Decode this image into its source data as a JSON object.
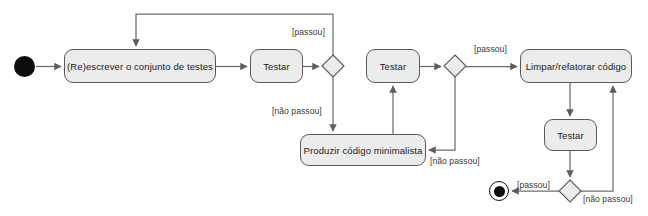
{
  "diagram": {
    "type": "uml-activity-diagram",
    "background_color": "#ffffff",
    "node_fill_color": "#ececec",
    "node_border_color": "#5a5a5a",
    "edge_color": "#6e6e6e",
    "text_color": "#1a1a1a",
    "nodes": [
      {
        "id": "start",
        "kind": "initial-node",
        "label": "",
        "x": 14,
        "y": 56,
        "w": 21,
        "h": 21
      },
      {
        "id": "rewrite-tests",
        "kind": "activity",
        "label": "(Re)escrever o conjunto de testes",
        "x": 64,
        "y": 49,
        "w": 152,
        "h": 34
      },
      {
        "id": "test-1",
        "kind": "activity",
        "label": "Testar",
        "x": 250,
        "y": 49,
        "w": 53,
        "h": 34
      },
      {
        "id": "decision-1",
        "kind": "decision",
        "label": "",
        "x": 322,
        "y": 55,
        "w": 22,
        "h": 22
      },
      {
        "id": "test-2",
        "kind": "activity",
        "label": "Testar",
        "x": 366,
        "y": 49,
        "w": 54,
        "h": 34
      },
      {
        "id": "decision-2",
        "kind": "decision",
        "label": "",
        "x": 444,
        "y": 55,
        "w": 22,
        "h": 22
      },
      {
        "id": "refactor-code",
        "kind": "activity",
        "label": "Limpar/refatorar código",
        "x": 520,
        "y": 49,
        "w": 112,
        "h": 34
      },
      {
        "id": "minimal-code",
        "kind": "activity",
        "label": "Produzir código minimalista",
        "x": 300,
        "y": 134,
        "w": 126,
        "h": 32
      },
      {
        "id": "test-3",
        "kind": "activity",
        "label": "Testar",
        "x": 544,
        "y": 119,
        "w": 53,
        "h": 32
      },
      {
        "id": "decision-3",
        "kind": "decision",
        "label": "",
        "x": 559,
        "y": 180,
        "w": 22,
        "h": 22
      },
      {
        "id": "end",
        "kind": "final-node",
        "label": "",
        "x": 489,
        "y": 181,
        "w": 20,
        "h": 20
      }
    ],
    "edge_labels": [
      {
        "id": "label-passou-top",
        "text": "[passou]",
        "x": 292,
        "y": 27
      },
      {
        "id": "label-nao-passou-left",
        "text": "[não passou]",
        "x": 272,
        "y": 106
      },
      {
        "id": "label-passou-right",
        "text": "[passou]",
        "x": 474,
        "y": 44
      },
      {
        "id": "label-nao-passou-mid",
        "text": "[não passou]",
        "x": 430,
        "y": 156
      },
      {
        "id": "label-passou-bottom",
        "text": "[passou]",
        "x": 517,
        "y": 180
      },
      {
        "id": "label-nao-passou-bottom",
        "text": "[não passou]",
        "x": 583,
        "y": 194
      }
    ],
    "edges": [
      {
        "id": "edge-start-to-rewrite",
        "from": "start",
        "to": "rewrite-tests"
      },
      {
        "id": "edge-rewrite-to-test1",
        "from": "rewrite-tests",
        "to": "test-1"
      },
      {
        "id": "edge-test1-to-decision1",
        "from": "test-1",
        "to": "decision-1"
      },
      {
        "id": "edge-decision1-passou-loop",
        "from": "decision-1",
        "to": "rewrite-tests",
        "label": "[passou]"
      },
      {
        "id": "edge-decision1-nao-passou",
        "from": "decision-1",
        "to": "minimal-code",
        "label": "[não passou]"
      },
      {
        "id": "edge-minimal-to-test2",
        "from": "minimal-code",
        "to": "test-2"
      },
      {
        "id": "edge-test2-to-decision2",
        "from": "test-2",
        "to": "decision-2"
      },
      {
        "id": "edge-decision2-passou",
        "from": "decision-2",
        "to": "refactor-code",
        "label": "[passou]"
      },
      {
        "id": "edge-decision2-nao-passou",
        "from": "decision-2",
        "to": "minimal-code",
        "label": "[não passou]"
      },
      {
        "id": "edge-refactor-to-test3",
        "from": "refactor-code",
        "to": "test-3"
      },
      {
        "id": "edge-test3-to-decision3",
        "from": "test-3",
        "to": "decision-3"
      },
      {
        "id": "edge-decision3-passou-to-end",
        "from": "decision-3",
        "to": "end",
        "label": "[passou]"
      },
      {
        "id": "edge-decision3-nao-passou-to-refactor",
        "from": "decision-3",
        "to": "refactor-code",
        "label": "[não passou]"
      }
    ]
  }
}
